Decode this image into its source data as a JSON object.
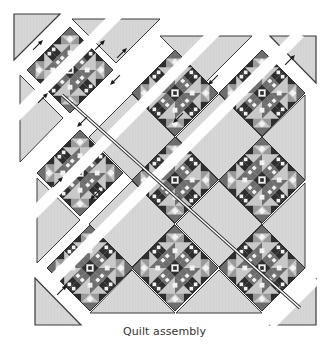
{
  "figure": {
    "caption": "Quilt assembly",
    "layout": "on-point 3x3 block setting with setting triangles and corner triangles, assembled in diagonal rows",
    "colors": {
      "background": "#ffffff",
      "setting_fabric": "#d6d6d6",
      "setting_stroke": "#3a3a3a",
      "block_dark": "#2e2e2e",
      "block_medium": "#6e6e6e",
      "block_mid_light": "#9a9a9a",
      "block_light": "#c8c8c8",
      "block_white": "#f2f2f2",
      "seam_gap": "#ffffff",
      "arrow": "#1a1a1a"
    },
    "block_half_diagonal": 43,
    "blocks": [
      {
        "id": "block-r1c1",
        "cx": 70,
        "cy": 70
      },
      {
        "id": "block-r1c2",
        "cx": 175,
        "cy": 93
      },
      {
        "id": "block-r1c3",
        "cx": 262,
        "cy": 93
      },
      {
        "id": "block-r2c1",
        "cx": 80,
        "cy": 173
      },
      {
        "id": "block-r2c2",
        "cx": 175,
        "cy": 180
      },
      {
        "id": "block-r2c3",
        "cx": 262,
        "cy": 180
      },
      {
        "id": "block-r3c1",
        "cx": 90,
        "cy": 268
      },
      {
        "id": "block-r3c2",
        "cx": 175,
        "cy": 268
      },
      {
        "id": "block-r3c3",
        "cx": 262,
        "cy": 268
      }
    ],
    "corner_triangles": [
      {
        "id": "corner-top-left",
        "points": "14,14 60,14 14,60"
      },
      {
        "id": "corner-top-right",
        "points": "270,36 316,36 316,83"
      },
      {
        "id": "corner-bottom-left",
        "points": "35,278 35,325 81,325"
      },
      {
        "id": "corner-bottom-right",
        "points": "316,279 316,325 270,325"
      }
    ],
    "setting_triangles": [
      {
        "id": "setting-top-1",
        "points": "72,19 160,19 116,63"
      },
      {
        "id": "setting-top-2",
        "points": "160,36 252,36 206,82"
      },
      {
        "id": "setting-left-1",
        "points": "20,75 20,162 63,118"
      },
      {
        "id": "setting-left-2",
        "points": "37,178 37,263 80,220"
      },
      {
        "id": "setting-right-1",
        "points": "305,95 305,180 262,137"
      },
      {
        "id": "setting-right-2",
        "points": "305,183 305,268 262,225"
      },
      {
        "id": "setting-bottom-1",
        "points": "90,313 175,313 132,270"
      },
      {
        "id": "setting-bottom-2",
        "points": "176,313 262,313 219,270"
      }
    ],
    "setting_squares": [
      {
        "id": "square-1",
        "cx": 132,
        "cy": 137
      },
      {
        "id": "square-2",
        "cx": 219,
        "cy": 137
      },
      {
        "id": "square-3",
        "cx": 132,
        "cy": 224
      },
      {
        "id": "square-4",
        "cx": 219,
        "cy": 224
      }
    ],
    "diagonal_rows": [
      {
        "id": "row-seam-1",
        "x1": 14,
        "y1": 118,
        "x2": 118,
        "y2": 14
      },
      {
        "id": "row-seam-2",
        "x1": 22,
        "y1": 225,
        "x2": 230,
        "y2": 17
      },
      {
        "id": "row-seam-3",
        "x1": 48,
        "y1": 285,
        "x2": 300,
        "y2": 33
      },
      {
        "id": "row-seam-4",
        "x1": 270,
        "y1": 325,
        "x2": 316,
        "y2": 279
      }
    ],
    "long_seam_line": {
      "x1": 62,
      "y1": 95,
      "x2": 300,
      "y2": 308
    },
    "arrows": [
      {
        "id": "arrow-1",
        "x": 38,
        "y": 45,
        "angle": -45
      },
      {
        "id": "arrow-2",
        "x": 100,
        "y": 45,
        "angle": -45
      },
      {
        "id": "arrow-3",
        "x": 43,
        "y": 98,
        "angle": -45
      },
      {
        "id": "arrow-4",
        "x": 122,
        "y": 53,
        "angle": -45
      },
      {
        "id": "arrow-5",
        "x": 115,
        "y": 80,
        "angle": 135
      },
      {
        "id": "arrow-6",
        "x": 82,
        "y": 122,
        "angle": 135
      },
      {
        "id": "arrow-7",
        "x": 58,
        "y": 182,
        "angle": -45
      },
      {
        "id": "arrow-8",
        "x": 95,
        "y": 195,
        "angle": 135
      },
      {
        "id": "arrow-9",
        "x": 213,
        "y": 80,
        "angle": 135
      },
      {
        "id": "arrow-10",
        "x": 290,
        "y": 60,
        "angle": -45
      },
      {
        "id": "arrow-11",
        "x": 178,
        "y": 118,
        "angle": 135
      },
      {
        "id": "arrow-12",
        "x": 62,
        "y": 290,
        "angle": -45
      }
    ]
  }
}
